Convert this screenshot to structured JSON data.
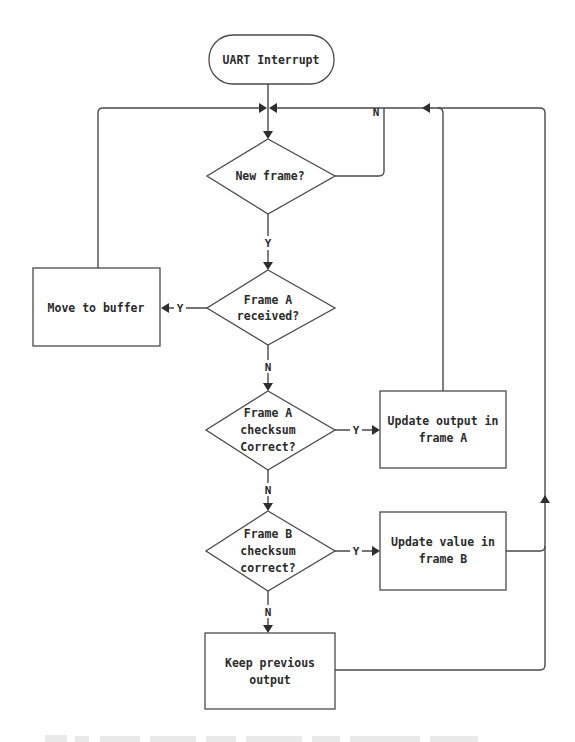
{
  "diagram": {
    "type": "flowchart",
    "colors": {
      "stroke": "#4a4a4a",
      "text": "#2b2b2b",
      "background": "#ffffff"
    },
    "nodes": {
      "start": {
        "shape": "terminator",
        "label": "UART Interrupt"
      },
      "new_frame": {
        "shape": "decision",
        "lines": [
          "New frame?"
        ]
      },
      "frame_a_received": {
        "shape": "decision",
        "lines": [
          "Frame A",
          "received?"
        ]
      },
      "move_to_buffer": {
        "shape": "process",
        "lines": [
          "Move to buffer"
        ]
      },
      "frame_a_checksum": {
        "shape": "decision",
        "lines": [
          "Frame A",
          "checksum",
          "Correct?"
        ]
      },
      "update_output_a": {
        "shape": "process",
        "lines": [
          "Update output in",
          "frame A"
        ]
      },
      "frame_b_checksum": {
        "shape": "decision",
        "lines": [
          "Frame B",
          "checksum",
          "correct?"
        ]
      },
      "update_value_b": {
        "shape": "process",
        "lines": [
          "Update value in",
          "frame B"
        ]
      },
      "keep_previous": {
        "shape": "process",
        "lines": [
          "Keep previous",
          "output"
        ]
      }
    },
    "edge_labels": {
      "new_frame_no": "N",
      "new_frame_yes": "Y",
      "frame_a_received_yes": "Y",
      "frame_a_received_no": "N",
      "frame_a_checksum_yes": "Y",
      "frame_a_checksum_no": "N",
      "frame_b_checksum_yes": "Y",
      "frame_b_checksum_no": "N"
    },
    "edges": [
      {
        "from": "start",
        "to": "new_frame"
      },
      {
        "from": "new_frame",
        "to": "new_frame",
        "label": "N"
      },
      {
        "from": "new_frame",
        "to": "frame_a_received",
        "label": "Y"
      },
      {
        "from": "frame_a_received",
        "to": "move_to_buffer",
        "label": "Y"
      },
      {
        "from": "move_to_buffer",
        "to": "new_frame"
      },
      {
        "from": "frame_a_received",
        "to": "frame_a_checksum",
        "label": "N"
      },
      {
        "from": "frame_a_checksum",
        "to": "update_output_a",
        "label": "Y"
      },
      {
        "from": "update_output_a",
        "to": "new_frame"
      },
      {
        "from": "frame_a_checksum",
        "to": "frame_b_checksum",
        "label": "N"
      },
      {
        "from": "frame_b_checksum",
        "to": "update_value_b",
        "label": "Y"
      },
      {
        "from": "update_value_b",
        "to": "new_frame"
      },
      {
        "from": "frame_b_checksum",
        "to": "keep_previous",
        "label": "N"
      },
      {
        "from": "keep_previous",
        "to": "new_frame"
      }
    ]
  }
}
